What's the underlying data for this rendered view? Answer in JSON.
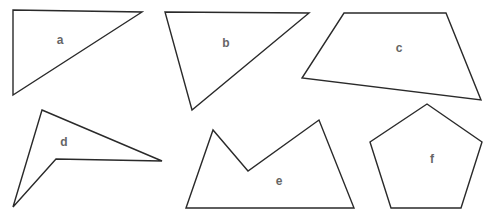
{
  "diagram": {
    "shapes": [
      {
        "id": "a",
        "label": "a",
        "type": "triangle",
        "points": "13,10 142,12 13,95",
        "label_pos": [
          60,
          41
        ]
      },
      {
        "id": "b",
        "label": "b",
        "type": "triangle",
        "points": "165,12 309,13 192,110",
        "label_pos": [
          226,
          44
        ]
      },
      {
        "id": "c",
        "label": "c",
        "type": "quadrilateral",
        "points": "344,13 446,13 481,100 302,78",
        "label_pos": [
          399,
          49
        ]
      },
      {
        "id": "d",
        "label": "d",
        "type": "concave-quadrilateral",
        "points": "42,110 162,161 56,159 13,207",
        "label_pos": [
          64,
          143
        ]
      },
      {
        "id": "e",
        "label": "e",
        "type": "concave-pentagon",
        "points": "186,208 213,130 248,171 319,120 354,208",
        "label_pos": [
          279,
          182
        ]
      },
      {
        "id": "f",
        "label": "f",
        "type": "pentagon",
        "points": "427,104 482,142 461,208 391,208 370,142",
        "label_pos": [
          432,
          160
        ]
      }
    ],
    "stroke_color": "#2a2a2a",
    "label_color": "#666666"
  }
}
